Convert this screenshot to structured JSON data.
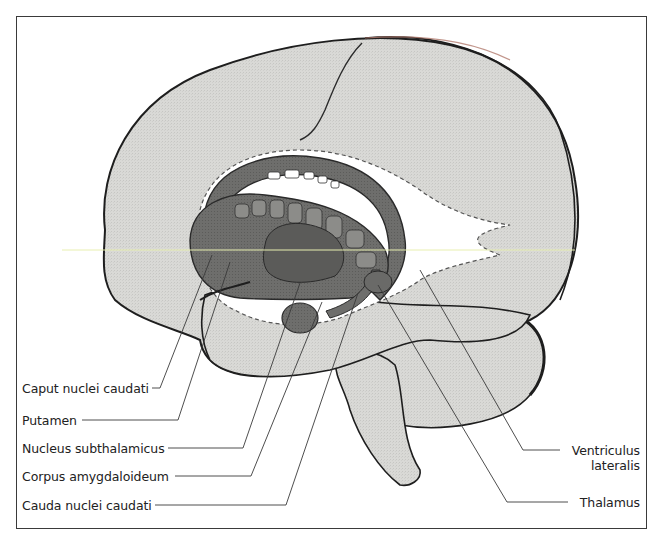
{
  "figure": {
    "colors": {
      "brain_fill": "#d9d9d6",
      "outline": "#1e1e1e",
      "basal_ganglia_fill": "#6e6e6c",
      "basal_ganglia_dark": "#4f4f4d",
      "ventricle_fill": "#ffffff",
      "leader_line": "#3a3a3a",
      "scan_line": "#e8efb0",
      "rim_tint": "#e7cfc9"
    },
    "labels_left": [
      {
        "id": "caput",
        "text": "Caput nuclei caudati"
      },
      {
        "id": "putamen",
        "text": "Putamen"
      },
      {
        "id": "subthal",
        "text": "Nucleus subthalamicus"
      },
      {
        "id": "amygdala",
        "text": "Corpus amygdaloideum"
      },
      {
        "id": "cauda",
        "text": "Cauda nuclei caudati"
      }
    ],
    "labels_right": [
      {
        "id": "ventricle",
        "line1": "Ventriculus",
        "line2": "lateralis"
      },
      {
        "id": "thalamus",
        "text": "Thalamus"
      }
    ]
  }
}
